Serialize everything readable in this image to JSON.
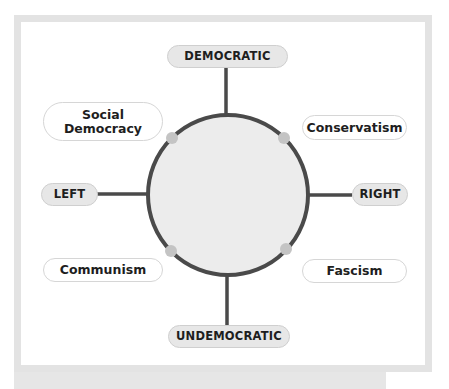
{
  "diagram": {
    "type": "political-spectrum-compass",
    "axes": {
      "top": "DEMOCRATIC",
      "bottom": "UNDEMOCRATIC",
      "left": "LEFT",
      "right": "RIGHT"
    },
    "ideologies": {
      "top_left": "Social Democracy",
      "top_right": "Conservatism",
      "bottom_left": "Communism",
      "bottom_right": "Fascism"
    },
    "colors": {
      "frame": "#e3e3e3",
      "line": "#4a4a4a",
      "circle_fill": "#ececec",
      "node_dot": "#c4c4c4",
      "axis_pill_fill": "#e7e7e7",
      "ideology_pill_fill": "#ffffff"
    }
  }
}
